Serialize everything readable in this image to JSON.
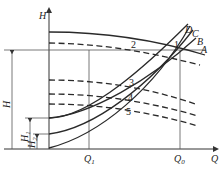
{
  "diagram": {
    "type": "pump head-flow characteristic diagram",
    "axes": {
      "y_label": "H",
      "x_label": "Q"
    },
    "x_ticks": [
      {
        "label": "Q",
        "sub": "1"
      },
      {
        "label": "Q",
        "sub": "0"
      }
    ],
    "dimensions": {
      "total": {
        "label": "H",
        "sub": ""
      },
      "h1": {
        "label": "H",
        "sub": "1"
      },
      "h2": {
        "label": "H",
        "sub": "2"
      }
    },
    "points": [
      "1",
      "2",
      "3",
      "4",
      "5"
    ],
    "curve_labels": [
      "A",
      "B",
      "C",
      "D"
    ],
    "legend": {
      "solid": "pump/system curve",
      "dashed": "pump characteristic curve"
    }
  }
}
